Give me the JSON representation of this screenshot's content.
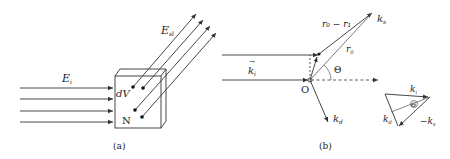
{
  "panel_a": {
    "caption": "(a)",
    "incident_label": "E",
    "incident_sub": "i",
    "scattered_label": "E",
    "scattered_sub": "sl",
    "volume_label": "dV",
    "count_label": "N",
    "incident_rays": 4,
    "scattered_rays": 4
  },
  "panel_b": {
    "caption": "(b)",
    "origin_label": "O",
    "k_i_label": "k",
    "k_i_sub": "i",
    "k_s_label": "k",
    "k_s_sub": "s",
    "k_d_label": "k",
    "k_d_sub": "d",
    "r0_minus_r1_label": "r₀ − r₁",
    "r0_label": "r",
    "r0_sub": "0",
    "theta_label": "Θ"
  },
  "inset": {
    "k_i_label": "k",
    "k_i_sub": "i",
    "k_d_label": "k",
    "k_d_sub": "d",
    "minus_k_s_label": "−k",
    "minus_k_s_sub": "s",
    "theta_label": "Θ"
  },
  "colors": {
    "line": "#333333",
    "text": "#222222",
    "background": "#ffffff"
  }
}
